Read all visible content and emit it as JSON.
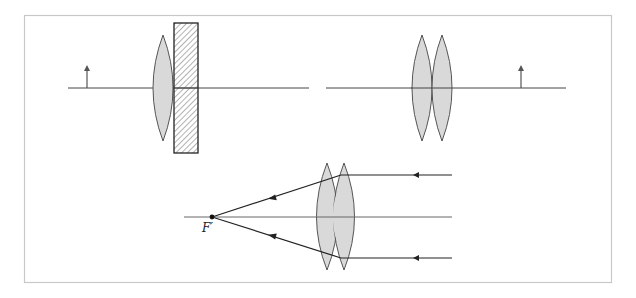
{
  "diagram": {
    "colors": {
      "border": "#c8c8c8",
      "line": "#333333",
      "axis": "#555555",
      "lens_fill": "#d9d9d9",
      "lens_stroke": "#555555",
      "slab_stroke": "#222222",
      "hatch": "#555555",
      "arrow": "#555555"
    },
    "panels": [
      {
        "id": "left",
        "elements": [
          "object-arrow",
          "converging-lens",
          "glass-slab"
        ]
      },
      {
        "id": "right",
        "elements": [
          "converging-lens",
          "converging-lens",
          "object-arrow"
        ]
      },
      {
        "id": "bottom",
        "elements": [
          "converging-lens",
          "converging-lens",
          "parallel-rays",
          "focal-point"
        ]
      }
    ],
    "focal_label": "F′"
  }
}
